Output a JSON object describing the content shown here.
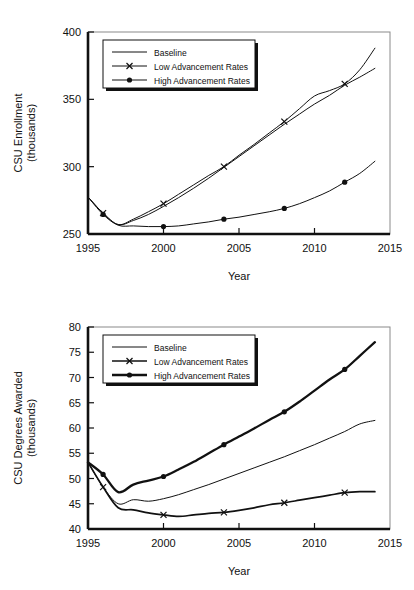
{
  "chart_data": [
    {
      "type": "line",
      "id": "csu-enrollment",
      "title": "",
      "xlabel": "Year",
      "ylabel": "CSU Enrollment\n(thousands)",
      "ylabel_line1": "CSU Enrollment",
      "ylabel_line2": "(thousands)",
      "xlim": [
        1995,
        2015
      ],
      "ylim": [
        250,
        400
      ],
      "xticks": [
        1995,
        2000,
        2005,
        2010,
        2015
      ],
      "yticks": [
        250,
        300,
        350,
        400
      ],
      "grid": false,
      "legend_position": "top-left",
      "series": [
        {
          "name": "Baseline",
          "marker": "none",
          "width": "thin",
          "x": [
            1995,
            1996,
            1997,
            1998,
            1999,
            2000,
            2001,
            2002,
            2003,
            2004,
            2005,
            2006,
            2007,
            2008,
            2009,
            2010,
            2011,
            2012,
            2013,
            2014
          ],
          "y": [
            277.5,
            265.5,
            257.0,
            260.0,
            264.5,
            270.5,
            277.0,
            284.0,
            291.5,
            299.5,
            307.5,
            315.5,
            323.5,
            331.5,
            339.0,
            346.5,
            353.0,
            360.5,
            366.5,
            373.0
          ]
        },
        {
          "name": "Low Advancement Rates",
          "marker": "x",
          "width": "thin",
          "x": [
            1995,
            1996,
            1997,
            1998,
            1999,
            2000,
            2001,
            2002,
            2003,
            2004,
            2005,
            2006,
            2007,
            2008,
            2009,
            2010,
            2011,
            2012,
            2013,
            2014
          ],
          "y": [
            277.5,
            265.5,
            257.0,
            261.0,
            266.5,
            272.5,
            279.5,
            286.5,
            293.5,
            300.0,
            308.5,
            316.5,
            325.0,
            333.5,
            343.0,
            352.5,
            356.5,
            361.5,
            372.0,
            388.0
          ],
          "marker_x": [
            1996,
            2000,
            2004,
            2008,
            2012
          ],
          "marker_y": [
            265.5,
            272.5,
            300.0,
            333.5,
            361.5
          ]
        },
        {
          "name": "High Advancement Rates",
          "marker": "circle",
          "width": "thin",
          "x": [
            1995,
            1996,
            1997,
            1998,
            1999,
            2000,
            2001,
            2002,
            2003,
            2004,
            2005,
            2006,
            2007,
            2008,
            2009,
            2010,
            2011,
            2012,
            2013,
            2014
          ],
          "y": [
            277.5,
            264.5,
            256.5,
            256.0,
            255.5,
            255.5,
            256.0,
            257.5,
            259.0,
            261.0,
            262.5,
            264.5,
            266.5,
            269.0,
            272.5,
            277.0,
            282.0,
            288.5,
            295.0,
            304.0
          ],
          "marker_x": [
            1996,
            2000,
            2004,
            2008,
            2012
          ],
          "marker_y": [
            264.5,
            255.5,
            261.0,
            269.0,
            288.5
          ]
        }
      ]
    },
    {
      "type": "line",
      "id": "csu-degrees-awarded",
      "title": "",
      "xlabel": "Year",
      "ylabel": "CSU Degrees Awarded\n(thousands)",
      "ylabel_line1": "CSU Degrees Awarded",
      "ylabel_line2": "(thousands)",
      "xlim": [
        1995,
        2015
      ],
      "ylim": [
        40,
        80
      ],
      "xticks": [
        1995,
        2000,
        2005,
        2010,
        2015
      ],
      "yticks": [
        40,
        45,
        50,
        55,
        60,
        65,
        70,
        75,
        80
      ],
      "grid": false,
      "legend_position": "top-left",
      "series": [
        {
          "name": "Baseline",
          "marker": "none",
          "width": "thin",
          "x": [
            1995,
            1996,
            1997,
            1998,
            1999,
            2000,
            2001,
            2002,
            2003,
            2004,
            2005,
            2006,
            2007,
            2008,
            2009,
            2010,
            2011,
            2012,
            2013,
            2014
          ],
          "y": [
            53.2,
            48.3,
            45.0,
            45.8,
            45.5,
            46.0,
            46.8,
            47.8,
            48.8,
            49.9,
            51.0,
            52.1,
            53.2,
            54.3,
            55.5,
            56.7,
            58.0,
            59.3,
            60.8,
            61.5
          ]
        },
        {
          "name": "Low Advancement Rates",
          "marker": "x",
          "width": "medium",
          "x": [
            1995,
            1996,
            1997,
            1998,
            1999,
            2000,
            2001,
            2002,
            2003,
            2004,
            2005,
            2006,
            2007,
            2008,
            2009,
            2010,
            2011,
            2012,
            2013,
            2014
          ],
          "y": [
            53.2,
            48.3,
            44.2,
            43.8,
            43.2,
            42.8,
            42.5,
            42.8,
            43.1,
            43.3,
            43.7,
            44.2,
            44.8,
            45.2,
            45.7,
            46.2,
            46.7,
            47.2,
            47.4,
            47.4
          ],
          "marker_x": [
            1996,
            2000,
            2004,
            2008,
            2012
          ],
          "marker_y": [
            48.3,
            42.8,
            43.3,
            45.2,
            47.2
          ]
        },
        {
          "name": "High Advancement Rates",
          "marker": "circle",
          "width": "thick",
          "x": [
            1995,
            1996,
            1997,
            1998,
            1999,
            2000,
            2001,
            2002,
            2003,
            2004,
            2005,
            2006,
            2007,
            2008,
            2009,
            2010,
            2011,
            2012,
            2013,
            2014
          ],
          "y": [
            53.2,
            50.8,
            47.3,
            48.8,
            49.6,
            50.4,
            51.8,
            53.3,
            55.0,
            56.7,
            58.3,
            59.9,
            61.6,
            63.2,
            65.2,
            67.4,
            69.6,
            71.6,
            74.3,
            77.0
          ],
          "marker_x": [
            1996,
            2000,
            2004,
            2008,
            2012
          ],
          "marker_y": [
            50.8,
            50.4,
            56.7,
            63.2,
            71.6
          ]
        }
      ]
    }
  ],
  "legend": {
    "entries": [
      {
        "label": "Baseline",
        "marker": "none"
      },
      {
        "label": "Low Advancement Rates",
        "marker": "x"
      },
      {
        "label": "High Advancement Rates",
        "marker": "circle"
      }
    ]
  },
  "colors": {
    "line": "#111111",
    "axis": "#111111",
    "frame": "#8a8a8a",
    "background": "#ffffff"
  }
}
